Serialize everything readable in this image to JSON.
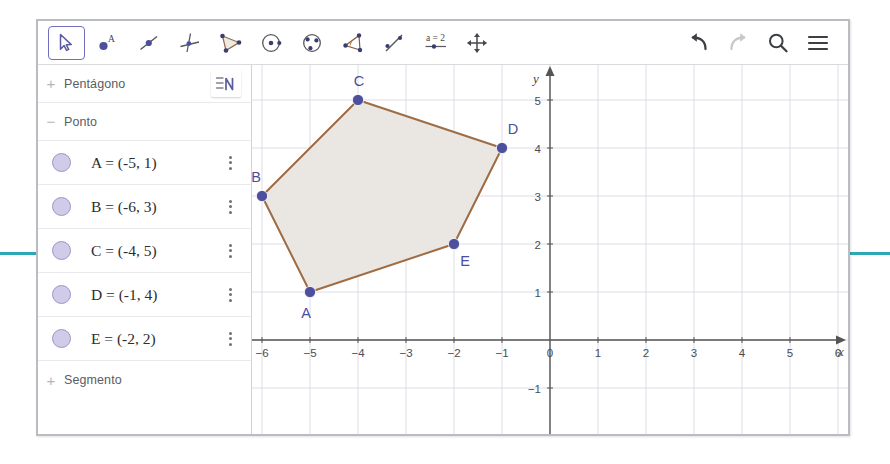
{
  "toolbar": {
    "tools": [
      {
        "name": "move-tool",
        "label": "Mover",
        "selected": true
      },
      {
        "name": "point-tool",
        "label": "Ponto",
        "selected": false
      },
      {
        "name": "segment-tool",
        "label": "Segmento",
        "selected": false
      },
      {
        "name": "perpendicular-line-tool",
        "label": "Reta Perpendicular",
        "selected": false
      },
      {
        "name": "polygon-tool",
        "label": "Polígono",
        "selected": false
      },
      {
        "name": "circle-center-point-tool",
        "label": "Círculo dados Centro e Um de seus Pontos",
        "selected": false
      },
      {
        "name": "circle-through-three-points-tool",
        "label": "Círculo definido por Três Pontos",
        "selected": false
      },
      {
        "name": "angle-tool",
        "label": "Ângulo",
        "selected": false
      },
      {
        "name": "reflect-about-line-tool",
        "label": "Reflexão em Relação a uma Reta",
        "selected": false
      },
      {
        "name": "slider-tool",
        "label": "a=2",
        "selected": false
      },
      {
        "name": "move-graphics-tool",
        "label": "Mover Janela de Visualização",
        "selected": false
      }
    ],
    "right_tools": [
      {
        "name": "undo-button",
        "label": "Desfazer",
        "enabled": true
      },
      {
        "name": "redo-button",
        "label": "Refazer",
        "enabled": false
      },
      {
        "name": "search-button",
        "label": "Pesquisar",
        "enabled": true
      },
      {
        "name": "menu-button",
        "label": "Menu",
        "enabled": true
      }
    ]
  },
  "sidebar": {
    "view_toggle_label": "Alternar Visualização",
    "groups": [
      {
        "name": "pentagono",
        "label": "Pentágono",
        "expander": "+",
        "expanded": false
      },
      {
        "name": "ponto",
        "label": "Ponto",
        "expander": "−",
        "expanded": true
      },
      {
        "name": "segmento",
        "label": "Segmento",
        "expander": "+",
        "expanded": false
      }
    ],
    "points": [
      {
        "name": "point-a",
        "equation": "A = (-5, 1)"
      },
      {
        "name": "point-b",
        "equation": "B = (-6, 3)"
      },
      {
        "name": "point-c",
        "equation": "C = (-4, 5)"
      },
      {
        "name": "point-d",
        "equation": "D = (-1, 4)"
      },
      {
        "name": "point-e",
        "equation": "E = (-2, 2)"
      }
    ]
  },
  "graph": {
    "x_axis_label": "x",
    "y_axis_label": "y",
    "x_ticks": [
      "-6",
      "-5",
      "-4",
      "-3",
      "-2",
      "-1",
      "0",
      "1",
      "2",
      "3",
      "4",
      "5",
      "6"
    ],
    "y_ticks": [
      "-1",
      "1",
      "2",
      "3",
      "4",
      "5"
    ],
    "x_range": [
      -6.6,
      6.4
    ],
    "y_range": [
      -1.6,
      5.9
    ],
    "grid": true,
    "unit_px": 48,
    "colors": {
      "polygon_stroke": "#9e6b43",
      "polygon_fill": "#e9e6e0",
      "point": "#4d4f9c",
      "label": "#4b4ea0",
      "axis": "#555555",
      "grid": "#dcdce6"
    },
    "polygon": {
      "name": "Pentágono",
      "vertices": [
        {
          "label": "A",
          "x": -5,
          "y": 1,
          "label_dx": -4,
          "label_dy": 26
        },
        {
          "label": "B",
          "x": -6,
          "y": 3,
          "label_dx": -6,
          "label_dy": -14
        },
        {
          "label": "C",
          "x": -4,
          "y": 5,
          "label_dx": 1,
          "label_dy": -14
        },
        {
          "label": "D",
          "x": -1,
          "y": 4,
          "label_dx": 11,
          "label_dy": -14
        },
        {
          "label": "E",
          "x": -2,
          "y": 2,
          "label_dx": 11,
          "label_dy": 22
        }
      ]
    }
  }
}
